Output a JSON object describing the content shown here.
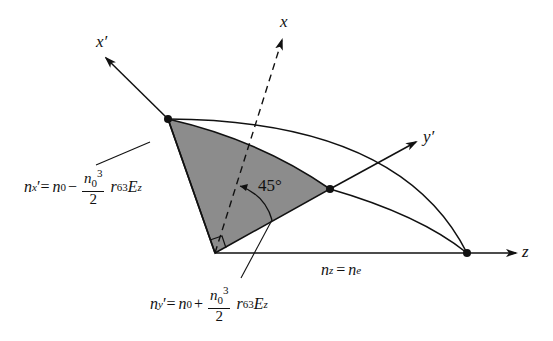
{
  "diagram": {
    "type": "index ellipsoid cross-section",
    "axes": {
      "x_prime": "x′",
      "x": "x",
      "y_prime": "y′",
      "z": "z"
    },
    "angle_label": "45°",
    "equations": {
      "nx_prime": {
        "lhs_base": "n",
        "lhs_sub": "x",
        "lhs_prime": "′=",
        "n0_base": "n",
        "n0_sub": "0",
        "op": "−",
        "frac_num_base": "n",
        "frac_num_sub": "0",
        "frac_num_sup": "3",
        "frac_den": "2",
        "r_base": "r",
        "r_sub": "63",
        "E_base": "E",
        "E_sub": "z"
      },
      "ny_prime": {
        "lhs_base": "n",
        "lhs_sub": "y",
        "lhs_prime": "′=",
        "n0_base": "n",
        "n0_sub": "0",
        "op": "+",
        "frac_num_base": "n",
        "frac_num_sub": "0",
        "frac_num_sup": "3",
        "frac_den": "2",
        "r_base": "r",
        "r_sub": "63",
        "E_base": "E",
        "E_sub": "z"
      },
      "nz": {
        "lhs_base": "n",
        "lhs_sub": "z",
        "eq": "=",
        "rhs_base": "n",
        "rhs_sub": "e"
      }
    },
    "colors": {
      "shade": "#8c8c8c",
      "line": "#111111"
    }
  }
}
